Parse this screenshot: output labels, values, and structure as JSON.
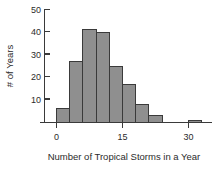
{
  "chart_data": {
    "type": "bar",
    "title": "",
    "subtitle": "",
    "xlabel": "Number of Tropical Storms in a Year",
    "ylabel": "# of Years",
    "bin_width": 3,
    "bin_starts": [
      0,
      3,
      6,
      9,
      12,
      15,
      18,
      21,
      30
    ],
    "categories": [
      "0-3",
      "3-6",
      "6-9",
      "9-12",
      "12-15",
      "15-18",
      "18-21",
      "21-24",
      "30-33"
    ],
    "values": [
      6,
      27,
      41,
      40,
      25,
      17,
      8,
      3,
      1
    ],
    "xlim": [
      -2,
      35
    ],
    "ylim": [
      0,
      50
    ],
    "xticks": [
      0,
      15,
      30
    ],
    "xtick_labels": [
      "0",
      "15",
      "30"
    ],
    "yticks": [
      10,
      20,
      30,
      40,
      50
    ],
    "ytick_labels": [
      "10",
      "20",
      "30",
      "40",
      "50"
    ],
    "grid": false,
    "legend": null,
    "bar_fill": "#8f8f8f",
    "bar_stroke": "#3a3a3a",
    "axis_color": "#3a3a3a",
    "text_color": "#2b2b2b",
    "background": "#ffffff"
  },
  "axis": {
    "x_title": "Number of Tropical Storms in a Year",
    "y_title": "# of Years",
    "x_labels": [
      "0",
      "15",
      "30"
    ],
    "y_labels": [
      "10",
      "20",
      "30",
      "40",
      "50"
    ]
  }
}
